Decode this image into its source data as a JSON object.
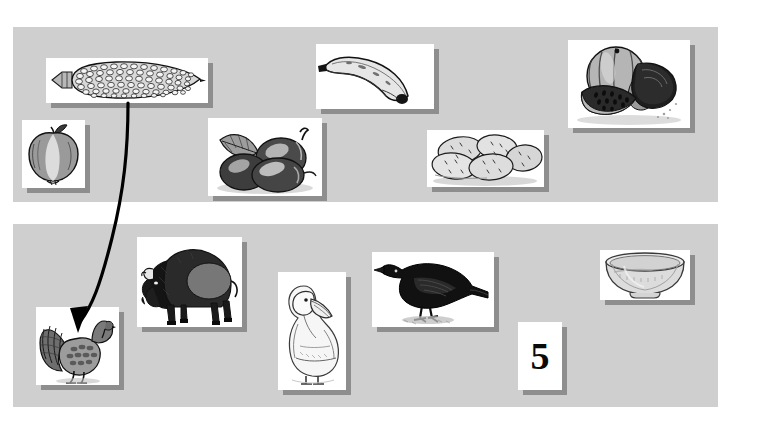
{
  "canvas": {
    "width": 758,
    "height": 424,
    "background": "#ffffff"
  },
  "theme": {
    "panel_fill": "#cfcfcf",
    "card_fill": "#ffffff",
    "card_shadow": "#828282",
    "ink": "#111111",
    "arrow_color": "#000000"
  },
  "panels": [
    {
      "name": "top-panel",
      "x": 13,
      "y": 27,
      "w": 705,
      "h": 175
    },
    {
      "name": "bottom-panel",
      "x": 13,
      "y": 224,
      "w": 705,
      "h": 183
    }
  ],
  "top_row": {
    "label": "plant-foods-row",
    "cards": [
      {
        "id": "corn",
        "label": "corn",
        "x": 46,
        "y": 58,
        "w": 162,
        "h": 45
      },
      {
        "id": "apple",
        "label": "apple",
        "x": 22,
        "y": 120,
        "w": 63,
        "h": 68
      },
      {
        "id": "plums",
        "label": "plums",
        "x": 208,
        "y": 118,
        "w": 114,
        "h": 78
      },
      {
        "id": "banana",
        "label": "banana",
        "x": 316,
        "y": 44,
        "w": 118,
        "h": 65
      },
      {
        "id": "potatoes",
        "label": "potatoes",
        "x": 427,
        "y": 130,
        "w": 117,
        "h": 57
      },
      {
        "id": "watermelon",
        "label": "watermelon",
        "x": 568,
        "y": 40,
        "w": 122,
        "h": 88
      }
    ]
  },
  "bottom_row": {
    "label": "animals-and-object-row",
    "cards": [
      {
        "id": "turkey",
        "label": "turkey",
        "x": 36,
        "y": 307,
        "w": 83,
        "h": 78
      },
      {
        "id": "bison",
        "label": "bison",
        "x": 137,
        "y": 237,
        "w": 105,
        "h": 90
      },
      {
        "id": "pelican",
        "label": "pelican",
        "x": 278,
        "y": 272,
        "w": 68,
        "h": 118
      },
      {
        "id": "crow",
        "label": "crow",
        "x": 372,
        "y": 252,
        "w": 122,
        "h": 75
      },
      {
        "id": "number",
        "label": "number-five-card",
        "text": "5",
        "x": 518,
        "y": 322,
        "w": 44,
        "h": 68
      },
      {
        "id": "bowl",
        "label": "bowl",
        "x": 600,
        "y": 250,
        "w": 90,
        "h": 50
      }
    ]
  },
  "annotations": {
    "arrow": {
      "name": "corn-to-turkey-arrow",
      "from": "corn",
      "to": "turkey",
      "color": "#000000",
      "width": 3.2,
      "path": "M 128 103 C 128 150 124 190 112 238 C 100 286 92 306 80 322",
      "head_tip_x": 78,
      "head_tip_y": 332
    }
  }
}
